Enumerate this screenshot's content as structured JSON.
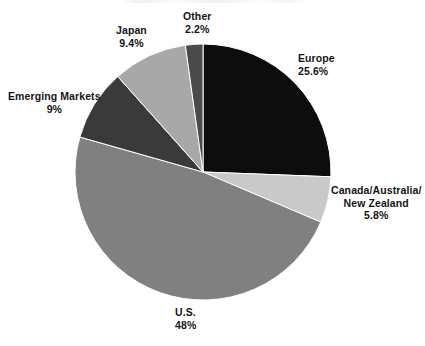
{
  "chart_data": {
    "type": "pie",
    "title": "",
    "xlabel": "",
    "ylabel": "",
    "legend_position": "none",
    "grid": false,
    "units": "percent",
    "total": 100,
    "start_angle_deg": 0,
    "direction": "clockwise",
    "center": {
      "x": 203,
      "y": 172
    },
    "radius": 128,
    "background_color": "#ffffff",
    "label_color": "#151515",
    "categories": [
      "Europe",
      "Canada/Australia/ New Zealand",
      "U.S.",
      "Emerging Markets",
      "Japan",
      "Other"
    ],
    "values": [
      25.6,
      5.8,
      48,
      9,
      9.4,
      2.2
    ],
    "slices": [
      {
        "name": "Europe",
        "label_lines": [
          "Europe"
        ],
        "value": 25.6,
        "value_label": "25.6%",
        "color": "#0d0d0d",
        "start_deg": 0,
        "end_deg": 92.16
      },
      {
        "name": "Canada/Australia/New Zealand",
        "label_lines": [
          "Canada/Australia/",
          "New Zealand"
        ],
        "value": 5.8,
        "value_label": "5.8%",
        "color": "#c9c9c9",
        "start_deg": 92.16,
        "end_deg": 113.04
      },
      {
        "name": "U.S.",
        "label_lines": [
          "U.S."
        ],
        "value": 48,
        "value_label": "48%",
        "color": "#808080",
        "start_deg": 113.04,
        "end_deg": 285.84
      },
      {
        "name": "Emerging Markets",
        "label_lines": [
          "Emerging Markets"
        ],
        "value": 9,
        "value_label": "9%",
        "color": "#3a3a3a",
        "start_deg": 285.84,
        "end_deg": 318.24
      },
      {
        "name": "Japan",
        "label_lines": [
          "Japan"
        ],
        "value": 9.4,
        "value_label": "9.4%",
        "color": "#a8a8a8",
        "start_deg": 318.24,
        "end_deg": 352.08
      },
      {
        "name": "Other",
        "label_lines": [
          "Other"
        ],
        "value": 2.2,
        "value_label": "2.2%",
        "color": "#4a4a4a",
        "start_deg": 352.08,
        "end_deg": 360
      }
    ]
  },
  "labels": {
    "europe": {
      "name": "Europe",
      "value": "25.6%"
    },
    "canada": {
      "line1": "Canada/Australia/",
      "line2": "New Zealand",
      "value": "5.8%"
    },
    "us": {
      "name": "U.S.",
      "value": "48%"
    },
    "emerging_markets": {
      "name": "Emerging Markets",
      "value": "9%"
    },
    "japan": {
      "name": "Japan",
      "value": "9.4%"
    },
    "other": {
      "name": "Other",
      "value": "2.2%"
    }
  }
}
